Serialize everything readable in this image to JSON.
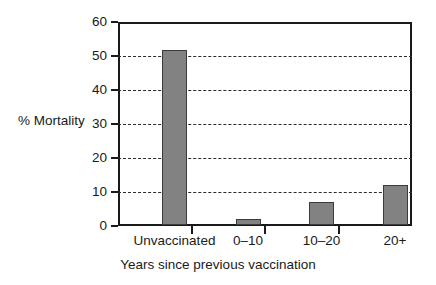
{
  "chart_data": {
    "type": "bar",
    "title": "",
    "xlabel": "Years since previous vaccination",
    "ylabel": "% Mortality",
    "categories": [
      "Unvaccinated",
      "0–10",
      "10–20",
      "20+"
    ],
    "values": [
      51.5,
      1.7,
      6.8,
      11.8
    ],
    "ylim": [
      0,
      60
    ],
    "ytick_values": [
      0,
      10,
      20,
      30,
      40,
      50,
      60
    ],
    "ytick_labels": [
      "0",
      "10",
      "20",
      "30",
      "40",
      "50",
      "60"
    ],
    "grid": "horizontal-dashed",
    "gridline_values": [
      10,
      20,
      30,
      40,
      50
    ],
    "legend": "none",
    "bar_color": "#828282",
    "bar_edge_color": "#3b3b3b",
    "axis_color": "#1a1a1a",
    "background_color": "#ffffff"
  }
}
